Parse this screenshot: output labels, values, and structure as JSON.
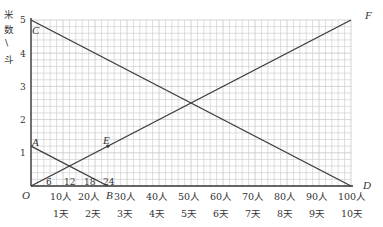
{
  "chart_data": {
    "type": "line",
    "title": "",
    "ylabel": "米数/斗",
    "xlabel_rows": [
      "人数",
      "天数"
    ],
    "ylim": [
      0,
      5
    ],
    "xlim": [
      0,
      100
    ],
    "y_ticks": [
      "1",
      "2",
      "3",
      "4",
      "5"
    ],
    "x_ticks_people": [
      "10人",
      "20人",
      "30人",
      "40人",
      "50人",
      "60人",
      "70人",
      "80人",
      "90人",
      "100人"
    ],
    "x_ticks_days": [
      "1天",
      "2天",
      "3天",
      "4天",
      "5天",
      "6天",
      "7天",
      "8天",
      "9天",
      "10天"
    ],
    "small_ticks": [
      "6",
      "12",
      "18",
      "24"
    ],
    "grid": true,
    "points": {
      "O": {
        "label": "O",
        "x": 0,
        "y": 0
      },
      "A": {
        "label": "A",
        "x": 0,
        "y": 1.2
      },
      "B": {
        "label": "B",
        "x": 24,
        "y": 0
      },
      "C": {
        "label": "C",
        "x": 0,
        "y": 5
      },
      "D": {
        "label": "D",
        "x": 100,
        "y": 0
      },
      "E": {
        "label": "E",
        "x": 24,
        "y": 1.2
      },
      "F": {
        "label": "F",
        "x": 100,
        "y": 5
      }
    },
    "series": [
      {
        "name": "CD",
        "x": [
          0,
          100
        ],
        "values": [
          5,
          0
        ]
      },
      {
        "name": "OF",
        "x": [
          0,
          100
        ],
        "values": [
          0,
          5
        ]
      },
      {
        "name": "AB",
        "x": [
          0,
          24
        ],
        "values": [
          1.2,
          0
        ]
      }
    ]
  },
  "labels": {
    "y_axis_chars": [
      "米",
      "数",
      "\\",
      "斗"
    ],
    "origin": "O",
    "A": "A",
    "B": "B",
    "C": "C",
    "D": "D",
    "E": "E",
    "F": "F"
  },
  "colors": {
    "line": "#3a3a3a",
    "grid": "#c8c8c8",
    "axis": "#333333"
  }
}
